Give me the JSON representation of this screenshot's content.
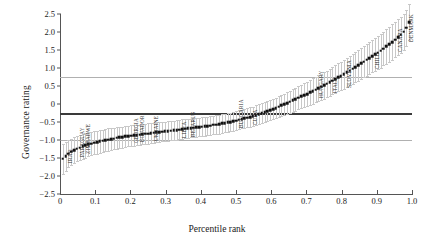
{
  "chart_data": {
    "type": "scatter",
    "title": "",
    "xlabel": "Percentile rank",
    "ylabel": "Governance rating",
    "xlim": [
      0,
      1.0
    ],
    "ylim": [
      -2.5,
      2.5
    ],
    "xticks": [
      "0",
      "0.1",
      "0.2",
      "0.3",
      "0.4",
      "0.5",
      "0.6",
      "0.7",
      "0.8",
      "0.9",
      "1.0"
    ],
    "xtick_values": [
      0,
      0.1,
      0.2,
      0.3,
      0.4,
      0.5,
      0.6,
      0.7,
      0.8,
      0.9,
      1.0
    ],
    "yticks": [
      "2.5",
      "2.0",
      "1.5",
      "1.0",
      "0.5",
      "0",
      "−0.5",
      "−1.0",
      "−1.5",
      "−2.0",
      "−2.5"
    ],
    "ytick_values": [
      2.5,
      2.0,
      1.5,
      1.0,
      0.5,
      0,
      -0.5,
      -1.0,
      -1.5,
      -2.0,
      -2.5
    ],
    "grid": false,
    "legend": "none",
    "marker": "black-square",
    "errorbar_color": "#c8c8c8",
    "reference_lines": [
      {
        "y": 0.75,
        "style": "thin-gray"
      },
      {
        "y": -0.25,
        "style": "thick-dark"
      },
      {
        "y": -1.0,
        "style": "thin-gray"
      }
    ],
    "x": [
      0.008,
      0.016,
      0.024,
      0.032,
      0.04,
      0.048,
      0.056,
      0.064,
      0.072,
      0.08,
      0.089,
      0.097,
      0.105,
      0.113,
      0.121,
      0.129,
      0.137,
      0.145,
      0.153,
      0.161,
      0.169,
      0.177,
      0.185,
      0.194,
      0.202,
      0.21,
      0.218,
      0.226,
      0.234,
      0.242,
      0.25,
      0.258,
      0.266,
      0.274,
      0.282,
      0.29,
      0.298,
      0.306,
      0.315,
      0.323,
      0.331,
      0.339,
      0.347,
      0.355,
      0.363,
      0.371,
      0.379,
      0.387,
      0.395,
      0.403,
      0.411,
      0.419,
      0.427,
      0.435,
      0.444,
      0.452,
      0.46,
      0.468,
      0.476,
      0.484,
      0.492,
      0.5,
      0.508,
      0.516,
      0.524,
      0.532,
      0.54,
      0.548,
      0.556,
      0.565,
      0.573,
      0.581,
      0.589,
      0.597,
      0.605,
      0.613,
      0.621,
      0.629,
      0.637,
      0.645,
      0.653,
      0.661,
      0.669,
      0.677,
      0.685,
      0.694,
      0.702,
      0.71,
      0.718,
      0.726,
      0.734,
      0.742,
      0.75,
      0.758,
      0.766,
      0.774,
      0.782,
      0.79,
      0.798,
      0.806,
      0.815,
      0.823,
      0.831,
      0.839,
      0.847,
      0.855,
      0.863,
      0.871,
      0.879,
      0.887,
      0.895,
      0.903,
      0.911,
      0.919,
      0.927,
      0.935,
      0.944,
      0.952,
      0.96,
      0.968,
      0.976,
      0.984,
      0.992
    ],
    "y": [
      -1.52,
      -1.45,
      -1.38,
      -1.33,
      -1.28,
      -1.24,
      -1.21,
      -1.18,
      -1.15,
      -1.12,
      -1.1,
      -1.08,
      -1.06,
      -1.04,
      -1.02,
      -1.0,
      -0.99,
      -0.97,
      -0.96,
      -0.94,
      -0.93,
      -0.92,
      -0.9,
      -0.89,
      -0.88,
      -0.87,
      -0.86,
      -0.85,
      -0.84,
      -0.83,
      -0.82,
      -0.81,
      -0.8,
      -0.79,
      -0.78,
      -0.77,
      -0.76,
      -0.75,
      -0.74,
      -0.73,
      -0.72,
      -0.71,
      -0.7,
      -0.69,
      -0.68,
      -0.67,
      -0.66,
      -0.65,
      -0.64,
      -0.63,
      -0.62,
      -0.61,
      -0.6,
      -0.58,
      -0.57,
      -0.56,
      -0.54,
      -0.53,
      -0.51,
      -0.5,
      -0.48,
      -0.46,
      -0.44,
      -0.42,
      -0.4,
      -0.38,
      -0.36,
      -0.34,
      -0.31,
      -0.28,
      -0.26,
      -0.23,
      -0.2,
      -0.17,
      -0.14,
      -0.11,
      -0.08,
      -0.04,
      -0.01,
      0.03,
      0.06,
      0.1,
      0.13,
      0.17,
      0.21,
      0.25,
      0.28,
      0.32,
      0.36,
      0.4,
      0.44,
      0.48,
      0.52,
      0.56,
      0.6,
      0.65,
      0.69,
      0.74,
      0.78,
      0.83,
      0.88,
      0.93,
      0.98,
      1.03,
      1.08,
      1.13,
      1.18,
      1.23,
      1.28,
      1.33,
      1.38,
      1.43,
      1.48,
      1.54,
      1.6,
      1.66,
      1.72,
      1.79,
      1.86,
      1.93,
      2.01,
      2.12,
      2.28
    ],
    "yerr": [
      0.42,
      0.4,
      0.38,
      0.37,
      0.36,
      0.35,
      0.35,
      0.34,
      0.34,
      0.33,
      0.33,
      0.32,
      0.32,
      0.32,
      0.31,
      0.31,
      0.31,
      0.3,
      0.3,
      0.3,
      0.3,
      0.29,
      0.29,
      0.29,
      0.29,
      0.29,
      0.28,
      0.28,
      0.28,
      0.28,
      0.28,
      0.28,
      0.28,
      0.27,
      0.27,
      0.27,
      0.27,
      0.27,
      0.27,
      0.27,
      0.27,
      0.27,
      0.27,
      0.26,
      0.26,
      0.26,
      0.26,
      0.26,
      0.26,
      0.26,
      0.26,
      0.26,
      0.26,
      0.26,
      0.26,
      0.26,
      0.26,
      0.26,
      0.26,
      0.26,
      0.26,
      0.26,
      0.26,
      0.26,
      0.27,
      0.27,
      0.27,
      0.27,
      0.27,
      0.27,
      0.28,
      0.28,
      0.28,
      0.28,
      0.29,
      0.29,
      0.29,
      0.3,
      0.3,
      0.3,
      0.31,
      0.31,
      0.32,
      0.32,
      0.33,
      0.33,
      0.34,
      0.34,
      0.35,
      0.35,
      0.36,
      0.36,
      0.37,
      0.37,
      0.38,
      0.38,
      0.39,
      0.39,
      0.4,
      0.4,
      0.41,
      0.41,
      0.42,
      0.42,
      0.43,
      0.43,
      0.44,
      0.44,
      0.45,
      0.45,
      0.46,
      0.46,
      0.47,
      0.47,
      0.48,
      0.48,
      0.49,
      0.49,
      0.5,
      0.5,
      0.5,
      0.5,
      0.5
    ],
    "annotations": [
      {
        "label": "IRAQ",
        "x": 0.013,
        "y": -1.48
      },
      {
        "label": "PARAGUAY",
        "x": 0.048,
        "y": -1.3
      },
      {
        "label": "ZIMBABWE",
        "x": 0.064,
        "y": -1.22
      },
      {
        "label": "GEORGIA",
        "x": 0.202,
        "y": -0.92
      },
      {
        "label": "ECUADOR",
        "x": 0.218,
        "y": -0.9
      },
      {
        "label": "UKRAINE",
        "x": 0.258,
        "y": -0.86
      },
      {
        "label": "LIBYA",
        "x": 0.339,
        "y": -0.78
      },
      {
        "label": "BELARUS",
        "x": 0.363,
        "y": -0.76
      },
      {
        "label": "BULGARIA",
        "x": 0.5,
        "y": -0.5
      },
      {
        "label": "CUBA",
        "x": 0.54,
        "y": -0.42
      },
      {
        "label": "HUNGARY",
        "x": 0.726,
        "y": 0.32
      },
      {
        "label": "ITALY",
        "x": 0.766,
        "y": 0.46
      },
      {
        "label": "SLOVENIA",
        "x": 0.806,
        "y": 0.6
      },
      {
        "label": "CHILE",
        "x": 0.887,
        "y": 1.14
      },
      {
        "label": "CANADA",
        "x": 0.952,
        "y": 1.62
      },
      {
        "label": "DENMARK",
        "x": 0.984,
        "y": 1.9
      }
    ]
  }
}
